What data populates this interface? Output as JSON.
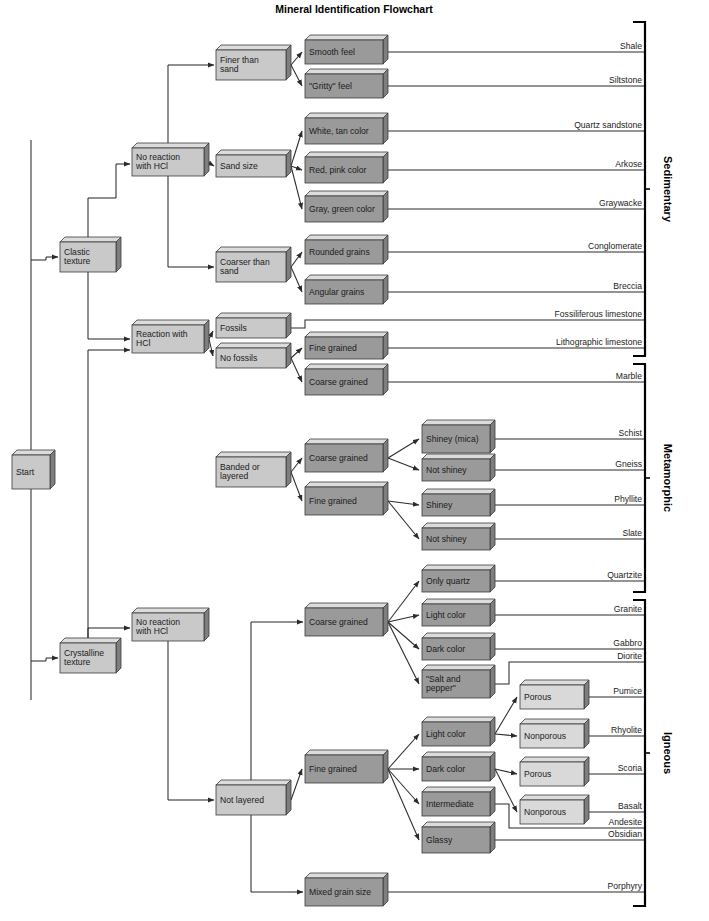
{
  "title": "Mineral Identification Flowchart",
  "colors": {
    "box_light": "#c9c9c9",
    "box_dark": "#9a9a9a",
    "box_xlight": "#d9d9d9",
    "box_top": "#dcdcdc",
    "box_side": "#7e7e7e",
    "stroke": "#3a3a3a",
    "line": "#2b2b2b",
    "bracket": "#000000",
    "text": "#1b1b1b"
  },
  "start": {
    "label": "Start"
  },
  "nodes": {
    "clastic_texture": "Clastic texture",
    "crystalline_texture": "Crystalline texture",
    "no_reaction_hcl_1": "No reaction with HCl",
    "reaction_hcl": "Reaction with HCl",
    "no_reaction_hcl_2": "No reaction with HCl",
    "finer_than_sand": "Finer than sand",
    "sand_size": "Sand size",
    "coarser_than_sand": "Coarser than sand",
    "fossils": "Fossils",
    "no_fossils": "No fossils",
    "banded_or_layered": "Banded or layered",
    "not_layered": "Not layered",
    "smooth_feel": "Smooth feel",
    "gritty_feel": "\"Gritty\" feel",
    "white_tan_color": "White, tan color",
    "red_pink_color": "Red, pink color",
    "gray_green_color": "Gray, green color",
    "rounded_grains": "Rounded grains",
    "angular_grains": "Angular grains",
    "fine_grained_sed": "Fine grained",
    "coarse_grained_sed": "Coarse grained",
    "coarse_grained_meta": "Coarse grained",
    "fine_grained_meta": "Fine grained",
    "shiney_mica": "Shiney (mica)",
    "not_shiney_1": "Not shiney",
    "shiney": "Shiney",
    "not_shiney_2": "Not shiney",
    "coarse_grained_ign": "Coarse grained",
    "fine_grained_ign": "Fine grained",
    "mixed_grain_size": "Mixed grain size",
    "only_quartz": "Only quartz",
    "light_color_c": "Light color",
    "dark_color_c": "Dark color",
    "salt_and_pepper": "\"Salt and pepper\"",
    "light_color_f": "Light color",
    "dark_color_f": "Dark color",
    "intermediate": "Intermediate",
    "glassy": "Glassy",
    "porous_1": "Porous",
    "nonporous_1": "Nonporous",
    "porous_2": "Porous",
    "nonporous_2": "Nonporous"
  },
  "results": {
    "shale": "Shale",
    "siltstone": "Siltstone",
    "quartz_sandstone": "Quartz sandstone",
    "arkose": "Arkose",
    "graywacke": "Graywacke",
    "conglomerate": "Conglomerate",
    "breccia": "Breccia",
    "fossiliferous_limestone": "Fossiliferous limestone",
    "lithographic_limestone": "Lithographic limestone",
    "marble": "Marble",
    "schist": "Schist",
    "gneiss": "Gneiss",
    "phyllite": "Phyllite",
    "slate": "Slate",
    "quartzite": "Quartzite",
    "granite": "Granite",
    "gabbro": "Gabbro",
    "diorite": "Diorite",
    "pumice": "Pumice",
    "rhyolite": "Rhyolite",
    "scoria": "Scoria",
    "basalt": "Basalt",
    "andesite": "Andesite",
    "obsidian": "Obsidian",
    "porphyry": "Porphyry"
  },
  "groups": {
    "sedimentary": "Sedimentary",
    "metamorphic": "Metamorphic",
    "igneous": "Igneous"
  },
  "chart_data": {
    "type": "diagram",
    "title": "Mineral Identification Flowchart",
    "diagram_kind": "decision-tree-flowchart",
    "root": "Start",
    "branches": [
      {
        "texture": "Clastic texture",
        "tests": [
          {
            "test": "No reaction with HCl",
            "grain": [
              {
                "size": "Finer than sand",
                "criteria": [
                  {
                    "feel": "Smooth feel",
                    "rock": "Shale"
                  },
                  {
                    "feel": "\"Gritty\" feel",
                    "rock": "Siltstone"
                  }
                ]
              },
              {
                "size": "Sand size",
                "criteria": [
                  {
                    "feel": "White, tan color",
                    "rock": "Quartz sandstone"
                  },
                  {
                    "feel": "Red, pink color",
                    "rock": "Arkose"
                  },
                  {
                    "feel": "Gray, green color",
                    "rock": "Graywacke"
                  }
                ]
              },
              {
                "size": "Coarser than sand",
                "criteria": [
                  {
                    "feel": "Rounded grains",
                    "rock": "Conglomerate"
                  },
                  {
                    "feel": "Angular grains",
                    "rock": "Breccia"
                  }
                ]
              }
            ]
          },
          {
            "test": "Reaction with HCl",
            "grain": [
              {
                "size": "Fossils",
                "criteria": [
                  {
                    "feel": "",
                    "rock": "Fossiliferous limestone"
                  }
                ]
              },
              {
                "size": "No fossils",
                "criteria": [
                  {
                    "feel": "Fine grained",
                    "rock": "Lithographic limestone"
                  },
                  {
                    "feel": "Coarse grained",
                    "rock": "Marble"
                  }
                ]
              }
            ]
          }
        ]
      },
      {
        "texture": "Crystalline texture",
        "tests": [
          {
            "test": "Banded or layered",
            "grain": [
              {
                "size": "Coarse grained",
                "criteria": [
                  {
                    "feel": "Shiney (mica)",
                    "rock": "Schist"
                  },
                  {
                    "feel": "Not shiney",
                    "rock": "Gneiss"
                  }
                ]
              },
              {
                "size": "Fine grained",
                "criteria": [
                  {
                    "feel": "Shiney",
                    "rock": "Phyllite"
                  },
                  {
                    "feel": "Not shiney",
                    "rock": "Slate"
                  }
                ]
              }
            ]
          },
          {
            "test": "Not layered",
            "grain": [
              {
                "size": "Coarse grained",
                "criteria": [
                  {
                    "feel": "Only quartz",
                    "rock": "Quartzite"
                  },
                  {
                    "feel": "Light color",
                    "rock": "Granite"
                  },
                  {
                    "feel": "Dark color",
                    "rock": "Gabbro"
                  },
                  {
                    "feel": "\"Salt and pepper\"",
                    "rock": "Diorite"
                  }
                ]
              },
              {
                "size": "Fine grained",
                "criteria": [
                  {
                    "feel": "Light color / Porous",
                    "rock": "Pumice"
                  },
                  {
                    "feel": "Light color / Nonporous",
                    "rock": "Rhyolite"
                  },
                  {
                    "feel": "Dark color / Porous",
                    "rock": "Scoria"
                  },
                  {
                    "feel": "Dark color / Nonporous",
                    "rock": "Basalt"
                  },
                  {
                    "feel": "Intermediate",
                    "rock": "Andesite"
                  },
                  {
                    "feel": "Glassy",
                    "rock": "Obsidian"
                  }
                ]
              },
              {
                "size": "Mixed grain size",
                "criteria": [
                  {
                    "feel": "",
                    "rock": "Porphyry"
                  }
                ]
              }
            ]
          }
        ]
      }
    ],
    "groups": [
      {
        "name": "Sedimentary",
        "rocks": [
          "Shale",
          "Siltstone",
          "Quartz sandstone",
          "Arkose",
          "Graywacke",
          "Conglomerate",
          "Breccia",
          "Fossiliferous limestone",
          "Lithographic limestone"
        ]
      },
      {
        "name": "Metamorphic",
        "rocks": [
          "Marble",
          "Schist",
          "Gneiss",
          "Phyllite",
          "Slate",
          "Quartzite"
        ]
      },
      {
        "name": "Igneous",
        "rocks": [
          "Granite",
          "Gabbro",
          "Diorite",
          "Pumice",
          "Rhyolite",
          "Scoria",
          "Basalt",
          "Andesite",
          "Obsidian",
          "Porphyry"
        ]
      }
    ]
  }
}
